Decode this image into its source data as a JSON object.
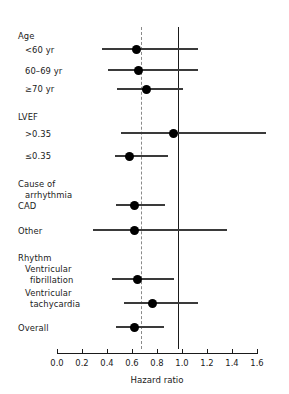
{
  "chart_data": {
    "type": "scatter",
    "title": "",
    "xlabel": "Hazard ratio",
    "ylabel": "",
    "xlim": [
      0.0,
      1.6
    ],
    "xticks": [
      "0.0",
      "0.2",
      "0.4",
      "0.6",
      "0.8",
      "1.0",
      "1.2",
      "1.4",
      "1.6"
    ],
    "xtick_values": [
      0.0,
      0.2,
      0.4,
      0.6,
      0.8,
      1.0,
      1.2,
      1.4,
      1.6
    ],
    "grid": false,
    "legend": "none",
    "reference_lines": [
      {
        "name": "null-effect-line",
        "value": 1.0,
        "style": "solid",
        "color": "#1a1a1a"
      },
      {
        "name": "overall-effect-line",
        "value": 0.62,
        "style": "dashed",
        "color": "#8a8a8a"
      }
    ],
    "groups": [
      {
        "heading": "Age",
        "rows": [
          {
            "label": "<60 yr",
            "estimate": 0.63,
            "low": 0.36,
            "high": 1.12,
            "clipped_high": false
          },
          {
            "label": "60–69 yr",
            "estimate": 0.65,
            "low": 0.41,
            "high": 1.12,
            "clipped_high": false
          },
          {
            "label": "≥70 yr",
            "estimate": 0.71,
            "low": 0.48,
            "high": 1.0,
            "clipped_high": false
          }
        ]
      },
      {
        "heading": "LVEF",
        "rows": [
          {
            "label": ">0.35",
            "estimate": 0.93,
            "low": 0.51,
            "high": 1.72,
            "clipped_high": true
          },
          {
            "label": "≤0.35",
            "estimate": 0.58,
            "low": 0.46,
            "high": 0.88,
            "clipped_high": false
          }
        ]
      },
      {
        "heading": "Cause of\n   arrhythmia",
        "rows": [
          {
            "label": "CAD",
            "estimate": 0.62,
            "low": 0.47,
            "high": 0.86,
            "clipped_high": false
          },
          {
            "label": "Other",
            "estimate": 0.62,
            "low": 0.29,
            "high": 1.35,
            "clipped_high": false
          }
        ]
      },
      {
        "heading": "Rhythm",
        "rows": [
          {
            "label": "Ventricular\n   fibrillation",
            "estimate": 0.64,
            "low": 0.44,
            "high": 0.93,
            "clipped_high": false
          },
          {
            "label": "Ventricular\n   tachycardia",
            "estimate": 0.76,
            "low": 0.53,
            "high": 1.12,
            "clipped_high": false
          }
        ]
      },
      {
        "heading": "",
        "rows": [
          {
            "label": "Overall",
            "estimate": 0.62,
            "low": 0.47,
            "high": 0.85,
            "clipped_high": false
          }
        ]
      }
    ]
  },
  "labels": {
    "age_heading": "Age",
    "age_r1": "<60 yr",
    "age_r2": "60–69 yr",
    "age_r3": "≥70 yr",
    "lvef_heading": "LVEF",
    "lvef_r1": ">0.35",
    "lvef_r2": "≤0.35",
    "cause_heading_l1": "Cause of",
    "cause_heading_l2": "arrhythmia",
    "cause_r1": "CAD",
    "cause_r2": "Other",
    "rhythm_heading": "Rhythm",
    "rhythm_r1_l1": "Ventricular",
    "rhythm_r1_l2": "fibrillation",
    "rhythm_r2_l1": "Ventricular",
    "rhythm_r2_l2": "tachycardia",
    "overall": "Overall"
  },
  "axis": {
    "title": "Hazard ratio",
    "t0": "0.0",
    "t1": "0.2",
    "t2": "0.4",
    "t3": "0.6",
    "t4": "0.8",
    "t5": "1.0",
    "t6": "1.2",
    "t7": "1.4",
    "t8": "1.6"
  }
}
